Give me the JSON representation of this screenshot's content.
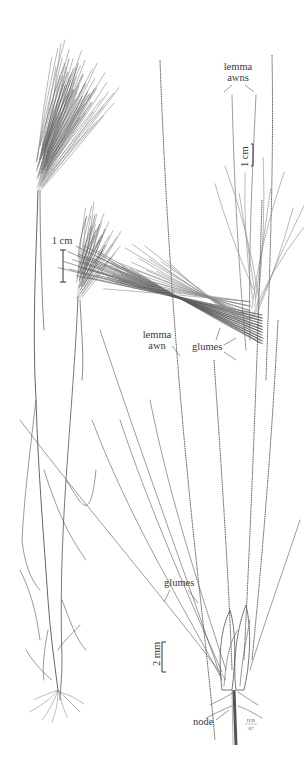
{
  "figure": {
    "labels": {
      "lemma_awns": [
        "lemma",
        "awns"
      ],
      "lemma_awn": [
        "lemma",
        "awn"
      ],
      "glumes_upper": "glumes",
      "glumes_lower": "glumes",
      "node": "node"
    },
    "scale_bars": {
      "habit": "1 cm",
      "spike": "1 cm",
      "spikelet": "2 mm"
    },
    "signature": [
      "H/B",
      "87"
    ]
  }
}
